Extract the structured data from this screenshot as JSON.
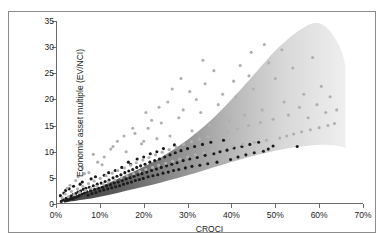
{
  "figure": {
    "border_color": "#8c8c8c",
    "background": "#ffffff"
  },
  "axis": {
    "x_title": "CROCI",
    "y_title": "Economic asset multiple (EV/NCI)",
    "x_ticks": [
      "0%",
      "10%",
      "20%",
      "30%",
      "40%",
      "50%",
      "60%",
      "70%"
    ],
    "y_ticks": [
      "0",
      "5",
      "10",
      "15",
      "20",
      "25",
      "30",
      "35"
    ]
  },
  "chart_data": {
    "type": "scatter",
    "title": "",
    "xlabel": "CROCI",
    "ylabel": "Economic asset multiple (EV/NCI)",
    "xlim": [
      0,
      70
    ],
    "ylim": [
      0,
      35
    ],
    "x_tick_values": [
      0,
      10,
      20,
      30,
      40,
      50,
      60,
      70
    ],
    "y_tick_values": [
      0,
      5,
      10,
      15,
      20,
      25,
      30,
      35
    ],
    "x_unit": "percent",
    "grid": false,
    "legend": "none",
    "band": {
      "description": "Shaded grey gradient band widening and flaring upward with increasing CROCI",
      "dark_color": "#4a4a4a",
      "light_color": "#e8e8e8",
      "upper_boundary": [
        [
          2,
          1.0
        ],
        [
          6,
          2.0
        ],
        [
          10,
          3.3
        ],
        [
          14,
          4.8
        ],
        [
          18,
          6.3
        ],
        [
          22,
          8.0
        ],
        [
          26,
          10.0
        ],
        [
          30,
          12.3
        ],
        [
          34,
          15.0
        ],
        [
          38,
          18.2
        ],
        [
          42,
          21.8
        ],
        [
          46,
          25.6
        ],
        [
          50,
          29.3
        ],
        [
          54,
          32.3
        ],
        [
          57,
          34.0
        ],
        [
          59,
          34.6
        ],
        [
          61,
          34.2
        ],
        [
          63,
          32.5
        ],
        [
          65,
          29.5
        ],
        [
          66,
          26.5
        ]
      ],
      "lower_boundary": [
        [
          2,
          0.3
        ],
        [
          6,
          0.8
        ],
        [
          10,
          1.4
        ],
        [
          14,
          2.1
        ],
        [
          18,
          2.9
        ],
        [
          22,
          3.7
        ],
        [
          26,
          4.6
        ],
        [
          30,
          5.5
        ],
        [
          34,
          6.5
        ],
        [
          38,
          7.5
        ],
        [
          42,
          8.5
        ],
        [
          46,
          9.4
        ],
        [
          50,
          10.2
        ],
        [
          54,
          10.8
        ],
        [
          58,
          11.2
        ],
        [
          62,
          11.3
        ],
        [
          65,
          11.0
        ],
        [
          66,
          10.6
        ]
      ]
    },
    "series": [
      {
        "name": "dark points",
        "color": "#1a1a1a",
        "marker": "circle",
        "points": [
          [
            1.2,
            0.5
          ],
          [
            1.6,
            0.8
          ],
          [
            2.0,
            0.6
          ],
          [
            2.3,
            1.1
          ],
          [
            2.6,
            0.7
          ],
          [
            2.9,
            1.3
          ],
          [
            3.1,
            0.9
          ],
          [
            3.4,
            1.5
          ],
          [
            3.7,
            1.0
          ],
          [
            3.9,
            1.8
          ],
          [
            4.2,
            1.2
          ],
          [
            4.5,
            2.0
          ],
          [
            4.8,
            1.4
          ],
          [
            5.0,
            2.3
          ],
          [
            5.3,
            1.6
          ],
          [
            5.6,
            2.5
          ],
          [
            5.9,
            1.9
          ],
          [
            6.2,
            2.8
          ],
          [
            6.5,
            2.1
          ],
          [
            6.8,
            3.0
          ],
          [
            7.0,
            2.4
          ],
          [
            7.3,
            1.7
          ],
          [
            7.6,
            3.2
          ],
          [
            7.9,
            2.6
          ],
          [
            8.2,
            2.0
          ],
          [
            8.5,
            3.5
          ],
          [
            8.8,
            2.8
          ],
          [
            9.1,
            2.2
          ],
          [
            9.4,
            3.8
          ],
          [
            9.7,
            3.0
          ],
          [
            10.0,
            2.5
          ],
          [
            10.3,
            4.0
          ],
          [
            10.6,
            3.2
          ],
          [
            10.9,
            2.7
          ],
          [
            11.2,
            4.3
          ],
          [
            11.5,
            3.5
          ],
          [
            11.8,
            2.9
          ],
          [
            12.1,
            4.6
          ],
          [
            12.4,
            3.7
          ],
          [
            12.7,
            3.1
          ],
          [
            13.0,
            5.0
          ],
          [
            13.3,
            4.0
          ],
          [
            13.6,
            3.3
          ],
          [
            13.9,
            5.3
          ],
          [
            14.2,
            4.2
          ],
          [
            14.5,
            3.5
          ],
          [
            14.8,
            5.6
          ],
          [
            15.1,
            4.5
          ],
          [
            15.4,
            3.8
          ],
          [
            15.7,
            6.0
          ],
          [
            16.0,
            4.8
          ],
          [
            16.3,
            4.0
          ],
          [
            16.6,
            6.3
          ],
          [
            16.9,
            5.0
          ],
          [
            17.2,
            4.2
          ],
          [
            17.5,
            6.6
          ],
          [
            17.8,
            5.3
          ],
          [
            18.1,
            4.5
          ],
          [
            18.4,
            7.0
          ],
          [
            18.7,
            5.6
          ],
          [
            19.0,
            4.7
          ],
          [
            19.3,
            7.3
          ],
          [
            19.6,
            5.8
          ],
          [
            19.9,
            4.9
          ],
          [
            20.3,
            7.6
          ],
          [
            20.7,
            6.1
          ],
          [
            21.0,
            5.2
          ],
          [
            21.4,
            8.0
          ],
          [
            21.8,
            6.4
          ],
          [
            22.1,
            5.4
          ],
          [
            22.5,
            8.3
          ],
          [
            22.9,
            6.7
          ],
          [
            23.2,
            5.6
          ],
          [
            23.6,
            8.6
          ],
          [
            24.0,
            7.0
          ],
          [
            24.4,
            5.9
          ],
          [
            24.8,
            9.0
          ],
          [
            25.2,
            7.3
          ],
          [
            25.6,
            6.1
          ],
          [
            26.0,
            9.4
          ],
          [
            26.4,
            7.6
          ],
          [
            26.8,
            6.4
          ],
          [
            27.2,
            9.8
          ],
          [
            27.6,
            7.9
          ],
          [
            28.0,
            6.6
          ],
          [
            28.5,
            10.2
          ],
          [
            29.0,
            8.3
          ],
          [
            29.5,
            6.9
          ],
          [
            30.0,
            10.6
          ],
          [
            30.5,
            8.6
          ],
          [
            31.0,
            7.2
          ],
          [
            31.6,
            11.0
          ],
          [
            32.2,
            8.9
          ],
          [
            32.8,
            7.4
          ],
          [
            33.4,
            11.4
          ],
          [
            34.0,
            9.3
          ],
          [
            34.6,
            7.7
          ],
          [
            35.3,
            11.8
          ],
          [
            36.0,
            9.6
          ],
          [
            36.7,
            8.0
          ],
          [
            37.4,
            10.0
          ],
          [
            38.2,
            12.2
          ],
          [
            39.0,
            10.3
          ],
          [
            39.8,
            8.5
          ],
          [
            40.6,
            10.7
          ],
          [
            41.5,
            9.0
          ],
          [
            42.4,
            11.0
          ],
          [
            43.3,
            9.4
          ],
          [
            44.2,
            11.4
          ],
          [
            45.2,
            9.8
          ],
          [
            46.2,
            11.8
          ],
          [
            47.3,
            10.1
          ],
          [
            48.4,
            10.5
          ],
          [
            49.5,
            11.1
          ],
          [
            55.0,
            11.0
          ],
          [
            4.0,
            3.4
          ],
          [
            6.0,
            4.2
          ],
          [
            8.0,
            4.8
          ],
          [
            12.0,
            6.0
          ],
          [
            15.0,
            7.0
          ],
          [
            17.0,
            7.6
          ],
          [
            20.0,
            9.0
          ],
          [
            23.0,
            10.0
          ],
          [
            2.2,
            2.6
          ],
          [
            3.0,
            2.9
          ],
          [
            5.5,
            3.8
          ],
          [
            9.0,
            5.2
          ],
          [
            11.0,
            5.5
          ],
          [
            13.5,
            6.4
          ],
          [
            16.5,
            8.0
          ],
          [
            18.5,
            8.6
          ],
          [
            21.5,
            9.6
          ],
          [
            24.5,
            10.6
          ],
          [
            27.0,
            11.3
          ],
          [
            1.0,
            1.6
          ],
          [
            1.8,
            2.1
          ]
        ]
      },
      {
        "name": "light grey points",
        "color": "#b0b0b0",
        "marker": "circle",
        "points": [
          [
            1.4,
            1.2
          ],
          [
            2.1,
            1.9
          ],
          [
            2.8,
            1.4
          ],
          [
            3.5,
            2.4
          ],
          [
            4.1,
            1.8
          ],
          [
            4.9,
            2.9
          ],
          [
            5.4,
            2.2
          ],
          [
            6.1,
            3.4
          ],
          [
            6.7,
            2.6
          ],
          [
            7.4,
            3.9
          ],
          [
            8.0,
            3.0
          ],
          [
            8.7,
            4.4
          ],
          [
            9.3,
            3.4
          ],
          [
            10.1,
            4.9
          ],
          [
            10.8,
            3.8
          ],
          [
            11.4,
            5.4
          ],
          [
            12.0,
            4.2
          ],
          [
            12.8,
            5.9
          ],
          [
            13.4,
            4.6
          ],
          [
            14.1,
            6.4
          ],
          [
            14.9,
            5.0
          ],
          [
            15.6,
            6.9
          ],
          [
            16.2,
            5.4
          ],
          [
            17.0,
            7.4
          ],
          [
            17.7,
            5.8
          ],
          [
            18.3,
            7.9
          ],
          [
            19.1,
            6.2
          ],
          [
            19.8,
            8.4
          ],
          [
            20.5,
            6.6
          ],
          [
            21.2,
            8.9
          ],
          [
            22.0,
            7.0
          ],
          [
            22.7,
            9.4
          ],
          [
            23.4,
            7.4
          ],
          [
            24.2,
            9.9
          ],
          [
            25.0,
            7.8
          ],
          [
            25.8,
            10.4
          ],
          [
            26.6,
            8.2
          ],
          [
            27.4,
            10.9
          ],
          [
            28.2,
            8.6
          ],
          [
            29.1,
            11.4
          ],
          [
            30.0,
            9.0
          ],
          [
            30.9,
            11.9
          ],
          [
            31.8,
            9.4
          ],
          [
            32.7,
            12.4
          ],
          [
            33.7,
            9.8
          ],
          [
            34.7,
            12.9
          ],
          [
            35.7,
            10.2
          ],
          [
            36.8,
            13.4
          ],
          [
            37.9,
            10.6
          ],
          [
            39.0,
            13.9
          ],
          [
            40.2,
            11.0
          ],
          [
            41.4,
            14.4
          ],
          [
            42.6,
            11.4
          ],
          [
            43.9,
            15.0
          ],
          [
            45.2,
            11.8
          ],
          [
            46.6,
            15.6
          ],
          [
            48.0,
            12.2
          ],
          [
            49.5,
            16.2
          ],
          [
            51.0,
            12.6
          ],
          [
            52.6,
            13.0
          ],
          [
            54.2,
            13.4
          ],
          [
            56.0,
            13.8
          ],
          [
            58.0,
            14.2
          ],
          [
            60.0,
            14.6
          ],
          [
            62.0,
            15.0
          ],
          [
            63.5,
            15.4
          ],
          [
            8.5,
            9.5
          ],
          [
            12.5,
            10.5
          ],
          [
            14.0,
            12.0
          ],
          [
            18.0,
            13.5
          ],
          [
            19.5,
            11.5
          ],
          [
            21.0,
            14.5
          ],
          [
            24.0,
            15.5
          ],
          [
            26.0,
            13.0
          ],
          [
            28.0,
            16.5
          ],
          [
            31.0,
            14.0
          ],
          [
            33.0,
            17.5
          ],
          [
            35.0,
            15.0
          ],
          [
            37.0,
            19.0
          ],
          [
            39.5,
            16.0
          ],
          [
            41.0,
            20.5
          ],
          [
            43.0,
            17.0
          ],
          [
            45.0,
            22.0
          ],
          [
            47.0,
            18.0
          ],
          [
            50.0,
            24.0
          ],
          [
            52.0,
            19.5
          ],
          [
            54.0,
            26.0
          ],
          [
            56.5,
            21.0
          ],
          [
            58.5,
            28.0
          ],
          [
            60.5,
            22.5
          ],
          [
            6.0,
            7.0
          ],
          [
            9.5,
            8.0
          ],
          [
            11.0,
            9.0
          ],
          [
            16.0,
            10.0
          ],
          [
            20.0,
            12.0
          ],
          [
            23.0,
            12.5
          ],
          [
            29.0,
            18.0
          ],
          [
            32.0,
            20.0
          ],
          [
            34.0,
            23.0
          ],
          [
            36.0,
            25.5
          ],
          [
            38.0,
            21.0
          ],
          [
            42.0,
            26.5
          ],
          [
            44.0,
            24.5
          ],
          [
            48.5,
            27.0
          ],
          [
            51.5,
            29.5
          ],
          [
            44.5,
            29.0
          ],
          [
            40.5,
            23.5
          ],
          [
            47.5,
            30.5
          ],
          [
            53.0,
            17.0
          ],
          [
            55.5,
            18.5
          ],
          [
            57.5,
            16.5
          ],
          [
            59.5,
            19.0
          ],
          [
            61.5,
            17.5
          ],
          [
            25.5,
            19.5
          ],
          [
            30.5,
            21.5
          ],
          [
            21.8,
            16.0
          ],
          [
            17.5,
            14.5
          ],
          [
            13.0,
            11.0
          ],
          [
            10.5,
            7.5
          ],
          [
            7.5,
            6.0
          ],
          [
            4.5,
            4.5
          ],
          [
            3.2,
            3.6
          ],
          [
            2.5,
            3.0
          ],
          [
            5.0,
            5.2
          ],
          [
            6.5,
            5.8
          ],
          [
            62.5,
            20.5
          ],
          [
            64.0,
            18.0
          ],
          [
            28.5,
            24.0
          ],
          [
            33.5,
            27.5
          ],
          [
            26.5,
            22.0
          ],
          [
            20.5,
            17.5
          ],
          [
            15.5,
            13.0
          ],
          [
            23.5,
            18.5
          ]
        ]
      }
    ]
  }
}
